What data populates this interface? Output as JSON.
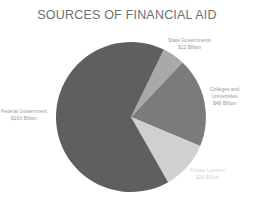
{
  "chart_data": {
    "type": "pie",
    "title": "SOURCES OF FINANCIAL AID",
    "categories": [
      "Federal Government",
      "State Governments",
      "Colleges and Universities",
      "Private Lenders"
    ],
    "values": [
      163,
      12,
      48,
      26
    ],
    "value_labels": [
      "$163 Billion",
      "$12 Billion",
      "$48 Billion",
      "$26 Billion"
    ],
    "unit": "Billion USD",
    "colors": [
      "#5f5f5f",
      "#a9a9a9",
      "#7b7b7b",
      "#d0d0d0"
    ],
    "start_angle_deg": 26,
    "order_note": "Slices proceed clockwise starting with State Governments at ~26° from top",
    "legend": "none (data labels beside slices)"
  },
  "labels": {
    "federal": {
      "name": "Federal Government",
      "value": "$163 Billion"
    },
    "state": {
      "name": "State Governments",
      "value": "$12 Billion"
    },
    "colleges": {
      "name1": "Colleges and",
      "name2": "Universities",
      "value": "$48 Billion"
    },
    "private": {
      "name": "Private Lenders",
      "value": "$26 Billion"
    }
  }
}
